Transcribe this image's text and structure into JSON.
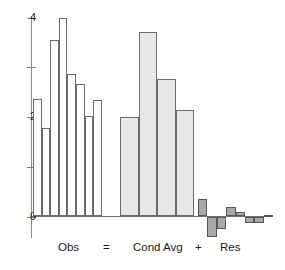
{
  "chart_data": {
    "type": "bar",
    "title": "",
    "subtitle": "",
    "xlabel": "",
    "ylabel": "",
    "ylim": [
      -0.7,
      4.2
    ],
    "grid": false,
    "legend": null,
    "axis": {
      "y_major_ticks": [
        0,
        2,
        4
      ],
      "y_major_tick_labels": [
        "0",
        "2",
        "4"
      ],
      "y_minor_ticks": [
        1,
        3
      ],
      "x_axis_at": 0,
      "x_tick_labels": []
    },
    "annotations": [
      {
        "text": "Obs",
        "role": "group-label"
      },
      {
        "text": "=",
        "role": "operator"
      },
      {
        "text": "Cond Avg",
        "role": "group-label"
      },
      {
        "text": "+",
        "role": "operator"
      },
      {
        "text": "Res",
        "role": "group-label"
      }
    ],
    "groups": [
      {
        "name": "Obs",
        "label": "Obs",
        "style": "open-outline",
        "fill": "#ffffff",
        "stroke": "#6b6b6b",
        "values": [
          2.36,
          1.78,
          3.56,
          4.0,
          2.86,
          2.66,
          2.02,
          2.34
        ]
      },
      {
        "name": "Cond Avg",
        "label": "Cond Avg",
        "style": "light-fill",
        "fill": "#e8e8e6",
        "stroke": "#6b6b6b",
        "values": [
          2.0,
          3.72,
          2.76,
          2.14
        ]
      },
      {
        "name": "Res",
        "label": "Res",
        "style": "gray-fill",
        "fill": "#a8a8a8",
        "stroke": "#585858",
        "values": [
          0.36,
          -0.42,
          -0.26,
          0.2,
          0.1,
          -0.14,
          -0.14,
          0.04
        ]
      }
    ],
    "series": [
      {
        "name": "Obs",
        "values": [
          2.36,
          1.78,
          3.56,
          4.0,
          2.86,
          2.66,
          2.02,
          2.34
        ]
      },
      {
        "name": "Cond Avg",
        "values": [
          2.0,
          3.72,
          2.76,
          2.14
        ]
      },
      {
        "name": "Res",
        "values": [
          0.36,
          -0.42,
          -0.26,
          0.2,
          0.1,
          -0.14,
          -0.14,
          0.04
        ]
      }
    ]
  },
  "caption": {
    "obs": "Obs",
    "equals": "=",
    "cond_avg": "Cond Avg",
    "plus": "+",
    "res": "Res"
  },
  "y_ticks": {
    "t0": "0",
    "t2": "2",
    "t4": "4"
  }
}
